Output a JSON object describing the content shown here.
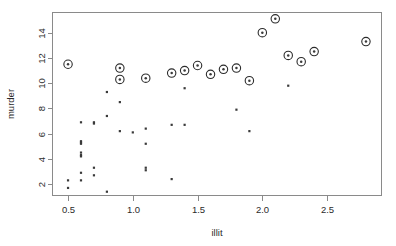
{
  "chart_data": {
    "type": "scatter",
    "title": "",
    "xlabel": "illit",
    "ylabel": "murder",
    "xlim": [
      0.38,
      2.92
    ],
    "ylim": [
      1.1,
      15.6
    ],
    "grid": false,
    "legend": "none",
    "xticks": [
      0.5,
      1.0,
      1.5,
      2.0,
      2.5
    ],
    "xtick_labels": [
      "0.5",
      "1.0",
      "1.5",
      "2.0",
      "2.5"
    ],
    "yticks": [
      2,
      4,
      6,
      8,
      10,
      12,
      14
    ],
    "ytick_labels": [
      "2",
      "4",
      "6",
      "8",
      "10",
      "12",
      "14"
    ],
    "series": [
      {
        "name": "points",
        "marker": "dot",
        "x": [
          0.5,
          0.5,
          0.6,
          0.6,
          0.6,
          0.6,
          0.6,
          0.6,
          0.6,
          0.6,
          0.6,
          0.7,
          0.7,
          0.7,
          0.7,
          0.8,
          0.8,
          0.8,
          0.9,
          0.9,
          1.0,
          1.1,
          1.1,
          1.1,
          1.1,
          1.3,
          1.3,
          1.4,
          1.4,
          1.8,
          1.9,
          2.2
        ],
        "y": [
          2.3,
          1.7,
          6.9,
          5.4,
          5.3,
          5.2,
          4.5,
          4.3,
          4.2,
          2.9,
          2.3,
          6.9,
          6.8,
          3.3,
          2.7,
          9.3,
          7.4,
          1.4,
          8.5,
          6.2,
          6.1,
          6.4,
          5.2,
          3.3,
          3.1,
          6.7,
          2.4,
          9.6,
          6.7,
          7.9,
          6.2,
          9.8
        ]
      },
      {
        "name": "highlighted-points",
        "marker": "circled-dot",
        "x": [
          0.5,
          0.9,
          0.9,
          1.1,
          1.3,
          1.4,
          1.5,
          1.6,
          1.7,
          1.8,
          1.9,
          2.0,
          2.1,
          2.2,
          2.3,
          2.4,
          2.8
        ],
        "y": [
          11.5,
          11.2,
          10.3,
          10.4,
          10.8,
          11.0,
          11.4,
          10.7,
          11.1,
          11.2,
          10.2,
          14.0,
          15.1,
          12.2,
          11.7,
          12.5,
          13.3
        ]
      }
    ]
  },
  "axes": {
    "x_title": "illit",
    "y_title": "murder"
  }
}
